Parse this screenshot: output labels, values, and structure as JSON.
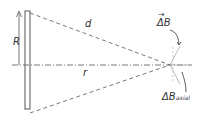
{
  "diagram": {
    "type": "physics-magnetic-field-of-ring",
    "labels": {
      "radius": "R",
      "distance": "d",
      "axial_distance": "r",
      "delta_b_vector": "ΔB",
      "delta_b_vector_arrow": "→",
      "delta_b_axial": "ΔB",
      "delta_b_axial_sub": "axial"
    },
    "colors": {
      "line": "#555555",
      "vector": "#aaaaaa",
      "text": "#333333"
    }
  }
}
